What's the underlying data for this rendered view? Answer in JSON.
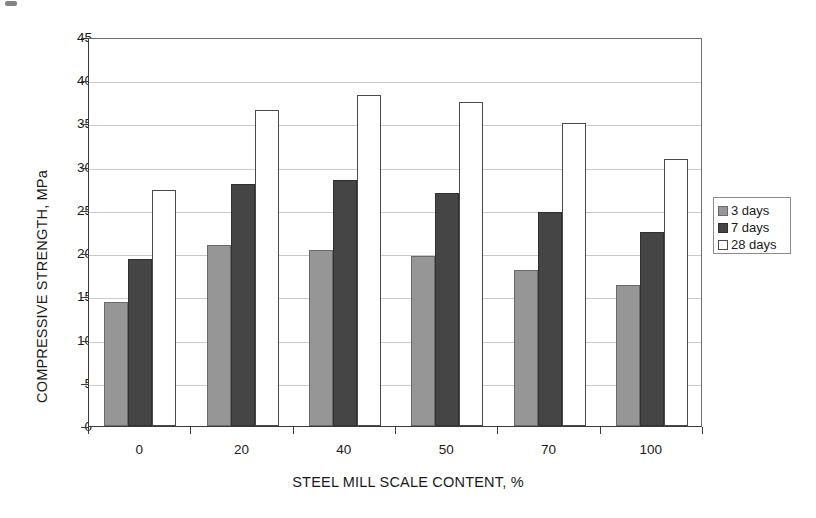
{
  "chart_data": {
    "type": "bar",
    "title": "",
    "xlabel": "STEEL MILL SCALE CONTENT, %",
    "ylabel": "COMPRESSIVE STRENGTH, MPa",
    "categories": [
      "0",
      "20",
      "40",
      "50",
      "70",
      "100"
    ],
    "series": [
      {
        "name": "3 days",
        "color": "#969696",
        "values": [
          14.4,
          20.9,
          20.4,
          19.7,
          18.0,
          16.3
        ]
      },
      {
        "name": "7 days",
        "color": "#454545",
        "values": [
          19.3,
          28.0,
          28.5,
          27.0,
          24.7,
          22.5
        ]
      },
      {
        "name": "28 days",
        "color": "#ffffff",
        "values": [
          27.3,
          36.5,
          38.3,
          37.5,
          35.0,
          30.9
        ]
      }
    ],
    "ylim": [
      0,
      45
    ],
    "ytick_labels": [
      "45",
      "40",
      "35",
      "30",
      "25",
      "20",
      "15",
      "10",
      "5",
      "0"
    ],
    "ytick_values": [
      45,
      40,
      35,
      30,
      25,
      20,
      15,
      10,
      5,
      0
    ],
    "ystep": 5,
    "grid": "horizontal",
    "legend_position": "right",
    "legend_entries": [
      "3 days",
      "7 days",
      "28 days"
    ]
  }
}
